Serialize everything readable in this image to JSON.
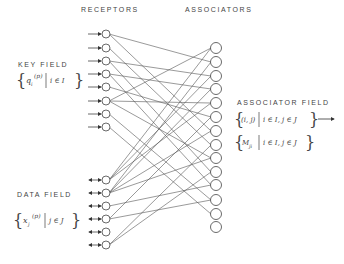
{
  "diagram": {
    "column_titles": {
      "receptors": "RECEPTORS",
      "associators": "ASSOCIATORS"
    },
    "key_field": {
      "title": "KEY FIELD",
      "set_open": "{",
      "var": "q",
      "sub": "i",
      "sup": "(p)",
      "cond": "i ∈ I",
      "set_close": "}"
    },
    "data_field": {
      "title": "DATA FIELD",
      "set_open": "{",
      "var": "x",
      "sub": "j",
      "sup": "(p)",
      "cond": "j ∈ J",
      "set_close": "}"
    },
    "associator_field": {
      "title": "ASSOCIATOR FIELD",
      "set1_var": "(i, j)",
      "set1_cond": "i ∈ I, j ∈ J",
      "set2_var": "M",
      "set2_sub": "ji",
      "set2_cond": "i ∈ I, j ∈ J"
    },
    "counts": {
      "key_receptors": 8,
      "data_receptors": 6,
      "associators": 14
    }
  }
}
